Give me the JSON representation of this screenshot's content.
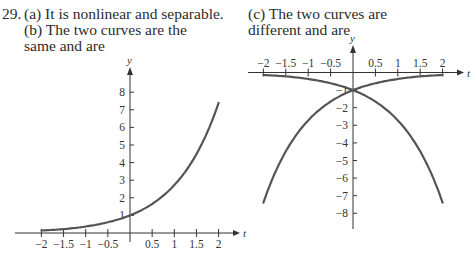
{
  "text": {
    "number": "29.",
    "part_a": "(a) It is nonlinear and separable.",
    "part_b_line1": "(b) The two curves are the",
    "part_b_line2": "same and are",
    "part_c_line1": "(c) The two curves are",
    "part_c_line2": "different and are"
  },
  "colors": {
    "curve": "#555555",
    "axis": "#333333",
    "text": "#2b2b2b"
  },
  "chart_data": [
    {
      "type": "line",
      "panel": "left",
      "title": "",
      "xlabel": "t",
      "ylabel": "y",
      "xlim": [
        -2,
        2
      ],
      "ylim": [
        0,
        8
      ],
      "x_ticks": [
        "-2",
        "-1.5",
        "-1",
        "-0.5",
        "0.5",
        "1",
        "1.5",
        "2"
      ],
      "y_ticks": [
        "1",
        "2",
        "3",
        "4",
        "5",
        "6",
        "7",
        "8"
      ],
      "grid": false,
      "series": [
        {
          "name": "y = e^t",
          "x": [
            -2,
            -1.5,
            -1,
            -0.5,
            0,
            0.5,
            1,
            1.5,
            2
          ],
          "values": [
            0.14,
            0.22,
            0.37,
            0.61,
            1.0,
            1.65,
            2.72,
            4.48,
            7.39
          ]
        }
      ]
    },
    {
      "type": "line",
      "panel": "right",
      "title": "",
      "xlabel": "t",
      "ylabel": "y",
      "xlim": [
        -2,
        2
      ],
      "ylim": [
        -8,
        0
      ],
      "x_ticks": [
        "-2",
        "-1.5",
        "-1",
        "-0.5",
        "0.5",
        "1",
        "1.5",
        "2"
      ],
      "y_ticks": [
        "-1",
        "-2",
        "-3",
        "-4",
        "-5",
        "-6",
        "-7",
        "-8"
      ],
      "grid": false,
      "series": [
        {
          "name": "upper curve",
          "x": [
            -2,
            -1.5,
            -1,
            -0.5,
            0,
            0.5,
            1,
            1.5,
            2
          ],
          "values": [
            -0.14,
            -0.22,
            -0.37,
            -0.61,
            -1.0,
            -1.65,
            -2.72,
            -4.48,
            -7.39
          ]
        },
        {
          "name": "lower curve",
          "x": [
            -2,
            -1.5,
            -1,
            -0.5,
            0,
            0.5,
            1,
            1.5,
            2
          ],
          "values": [
            -7.39,
            -4.48,
            -2.72,
            -1.65,
            -1.0,
            -0.61,
            -0.37,
            -0.22,
            -0.14
          ]
        }
      ]
    }
  ]
}
